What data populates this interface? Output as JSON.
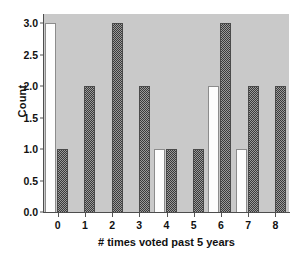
{
  "chart_data": {
    "type": "bar",
    "title": "",
    "xlabel": "# times voted past 5 years",
    "ylabel": "Count",
    "categories": [
      "0",
      "1",
      "2",
      "3",
      "4",
      "5",
      "6",
      "7",
      "8"
    ],
    "xtick_labels": [
      "0",
      "1",
      "2",
      "3",
      "4",
      "5",
      "6",
      "7",
      "8"
    ],
    "ytick_labels": [
      "0.0",
      "0.5",
      "1.0",
      "1.5",
      "2.0",
      "2.5",
      "3.0"
    ],
    "ytick_values": [
      0.0,
      0.5,
      1.0,
      1.5,
      2.0,
      2.5,
      3.0
    ],
    "ylim": [
      0,
      3.15
    ],
    "grid": false,
    "legend": "none",
    "plot_background": "#c9c9c9",
    "series": [
      {
        "name": "light",
        "fill": "white",
        "color": "#fdfdfd",
        "values": [
          3,
          0,
          0,
          0,
          1,
          0,
          2,
          1,
          0
        ]
      },
      {
        "name": "hatched",
        "fill": "dark-hatch",
        "color": "#3a3a3a",
        "values": [
          1,
          2,
          3,
          2,
          1,
          1,
          3,
          2,
          2
        ]
      }
    ]
  }
}
